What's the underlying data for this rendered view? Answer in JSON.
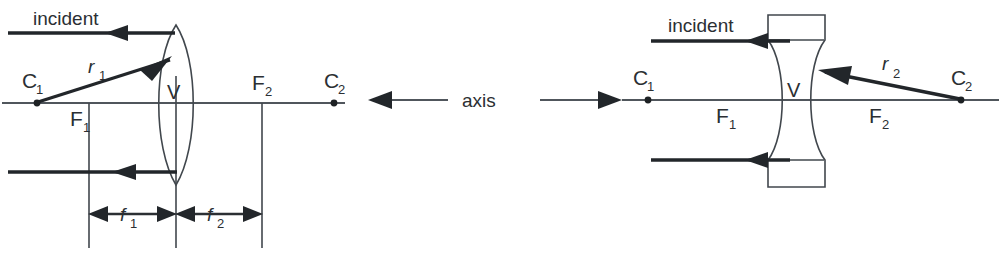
{
  "figure": {
    "background_color": "#ffffff",
    "ink_color": "#2b2f33",
    "axis_color": "#50565c",
    "width": 1001,
    "height": 255
  },
  "center": {
    "axis_label": "axis"
  },
  "left_panel": {
    "name": "converging-lens-diagram",
    "lens_type": "biconvex",
    "incident_label": "incident",
    "ray_label": "r",
    "ray_label_sub": "1",
    "vertex_label": "V",
    "points": [
      {
        "label": "C",
        "sub": "1",
        "name": "center-of-curvature-1"
      },
      {
        "label": "F",
        "sub": "1",
        "name": "focal-point-1"
      },
      {
        "label": "F",
        "sub": "2",
        "name": "focal-point-2"
      },
      {
        "label": "C",
        "sub": "2",
        "name": "center-of-curvature-2"
      }
    ],
    "dimensions": [
      {
        "label": "f",
        "sub": "1",
        "name": "focal-length-1"
      },
      {
        "label": "f",
        "sub": "2",
        "name": "focal-length-2"
      }
    ]
  },
  "right_panel": {
    "name": "diverging-lens-diagram",
    "lens_type": "biconcave",
    "incident_label": "incident",
    "ray_label": "r",
    "ray_label_sub": "2",
    "vertex_label": "V",
    "points": [
      {
        "label": "C",
        "sub": "1",
        "name": "center-of-curvature-1"
      },
      {
        "label": "F",
        "sub": "1",
        "name": "focal-point-1"
      },
      {
        "label": "F",
        "sub": "2",
        "name": "focal-point-2"
      },
      {
        "label": "C",
        "sub": "2",
        "name": "center-of-curvature-2"
      }
    ]
  }
}
